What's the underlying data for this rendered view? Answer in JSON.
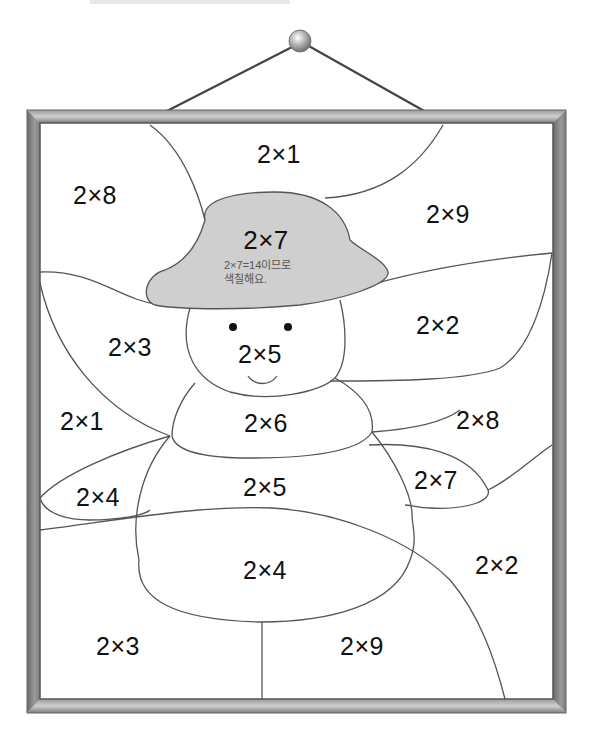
{
  "header": {
    "cut_off_text": ""
  },
  "picture": {
    "frame_color": "#7a7a7a",
    "line_color": "#555555",
    "hat_fill": "#cfcfcf",
    "hat": {
      "label": "2×7",
      "hint_line1": "2×7=14이므로",
      "hint_line2": "색칠해요."
    },
    "regions": [
      {
        "id": "top-center",
        "label": "2×1"
      },
      {
        "id": "top-left",
        "label": "2×8"
      },
      {
        "id": "top-right",
        "label": "2×9"
      },
      {
        "id": "left-arm-upper",
        "label": "2×3"
      },
      {
        "id": "face",
        "label": "2×5"
      },
      {
        "id": "right-upper",
        "label": "2×2"
      },
      {
        "id": "left-mid",
        "label": "2×1"
      },
      {
        "id": "neck",
        "label": "2×6"
      },
      {
        "id": "right-mid",
        "label": "2×8"
      },
      {
        "id": "left-hand",
        "label": "2×4"
      },
      {
        "id": "body-upper",
        "label": "2×5"
      },
      {
        "id": "right-hand",
        "label": "2×7"
      },
      {
        "id": "right-lower",
        "label": "2×2"
      },
      {
        "id": "body-lower",
        "label": "2×4"
      },
      {
        "id": "bottom-left",
        "label": "2×3"
      },
      {
        "id": "bottom-right",
        "label": "2×9"
      }
    ]
  }
}
